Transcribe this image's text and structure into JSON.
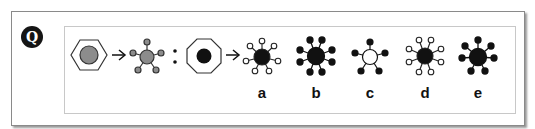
{
  "question": {
    "badge_label": "Q",
    "type": "figure-analogy",
    "premise": {
      "first_pair": {
        "left": "hexagon-with-gray-circle",
        "right": "gray-circle-6-spokes-gray-ends"
      },
      "separator": ":",
      "second_pair_left": "octagon-with-black-circle"
    },
    "options": [
      {
        "label": "a",
        "description": "black circle, 7 spokes, white ends"
      },
      {
        "label": "b",
        "description": "black circle, 8 spokes, black ends"
      },
      {
        "label": "c",
        "description": "white circle, 5 spokes, black ends"
      },
      {
        "label": "d",
        "description": "black circle, 8 spokes, white ends"
      },
      {
        "label": "e",
        "description": "black circle, 7 spokes, black ends"
      }
    ]
  },
  "colors": {
    "gray_fill": "#8c8c8c",
    "black_fill": "#111111",
    "white_fill": "#ffffff",
    "stroke": "#222222"
  }
}
